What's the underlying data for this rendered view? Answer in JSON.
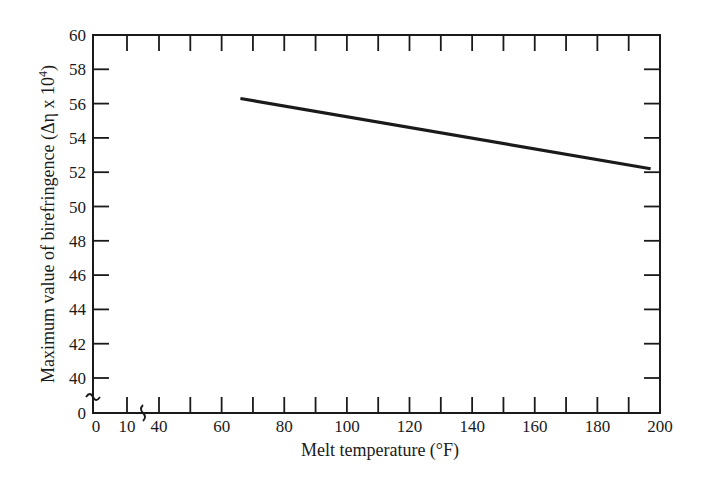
{
  "chart_data": {
    "type": "line",
    "title": "",
    "xlabel": "Melt temperature (°F)",
    "ylabel": "Maximum value of birefringence (Δη x 10⁴)",
    "ylabel_parts": {
      "main": "Maximum value of birefringence (Δη x 10",
      "sup": "4",
      "end": ")"
    },
    "x_ticks": [
      {
        "label": "0",
        "value": 0
      },
      {
        "label": "10",
        "value": 10
      },
      {
        "label": "40",
        "value": 40
      },
      {
        "label": "60",
        "value": 60
      },
      {
        "label": "80",
        "value": 80
      },
      {
        "label": "100",
        "value": 100
      },
      {
        "label": "120",
        "value": 120
      },
      {
        "label": "140",
        "value": 140
      },
      {
        "label": "160",
        "value": 160
      },
      {
        "label": "180",
        "value": 180
      },
      {
        "label": "200",
        "value": 200
      }
    ],
    "y_ticks": [
      "0",
      "40",
      "42",
      "44",
      "46",
      "48",
      "50",
      "52",
      "54",
      "56",
      "58",
      "60"
    ],
    "xlim": [
      40,
      200
    ],
    "ylim": [
      40,
      60
    ],
    "axis_breaks": {
      "x": "between 10 and 40",
      "y": "between 0 and 40"
    },
    "grid": false,
    "legend": null,
    "series": [
      {
        "name": "Maximum birefringence",
        "x": [
          66,
          197
        ],
        "y": [
          56.3,
          52.2
        ]
      }
    ]
  }
}
